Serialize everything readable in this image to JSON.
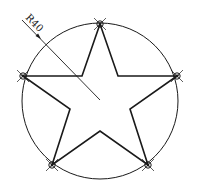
{
  "drawing": {
    "type": "cad-sketch",
    "description": "Five-pointed star inscribed in a circle with radius dimension",
    "stroke_color": "#1a1a1a",
    "background_color": "#ffffff",
    "circle": {
      "cx": 100,
      "cy": 101,
      "r": 78
    },
    "dimension": {
      "label": "R40",
      "leader_start": [
        22,
        20
      ],
      "leader_end": [
        100,
        100
      ],
      "arrow_at": [
        41,
        39
      ]
    },
    "star": {
      "outer_vertices": [
        [
          100,
          24
        ],
        [
          177,
          76
        ],
        [
          148,
          165
        ],
        [
          52,
          165
        ],
        [
          23,
          76
        ]
      ],
      "inner_vertices": [
        [
          118,
          76
        ],
        [
          130,
          109
        ],
        [
          100,
          131
        ],
        [
          70,
          109
        ],
        [
          82,
          76
        ]
      ]
    },
    "vertex_markers": [
      {
        "name": "top",
        "x": 100,
        "y": 24
      },
      {
        "name": "right",
        "x": 177,
        "y": 76
      },
      {
        "name": "bottom-right",
        "x": 148,
        "y": 165
      },
      {
        "name": "bottom-left",
        "x": 52,
        "y": 165
      },
      {
        "name": "left",
        "x": 23,
        "y": 76
      }
    ]
  }
}
